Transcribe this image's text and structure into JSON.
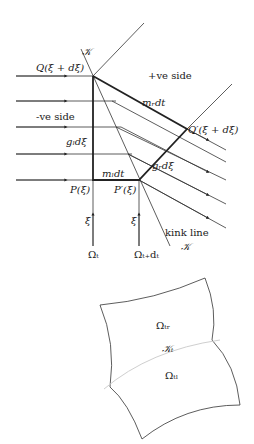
{
  "upper_diagram": {
    "points": {
      "Q": "Q(ξ + dξ)",
      "Q_prime": "Q′(ξ + dξ)",
      "P": "P(ξ)",
      "P_prime": "P′(ξ)"
    },
    "regions": {
      "positive": "+ve side",
      "negative": "-ve side"
    },
    "segments": {
      "m_r": "mᵣdt",
      "m_l": "mₗdt",
      "g_l": "gₗdξ",
      "g_r": "gᵣdξ"
    },
    "kink": {
      "top_label": "𝒦",
      "bottom_label_line1": "kink line",
      "bottom_label_line2": "𝒦"
    },
    "axes": {
      "xi_left": "ξ",
      "xi_right": "ξ",
      "omega_t": "Ωₜ",
      "omega_t_dt": "Ωₜ₊dₜ"
    }
  },
  "lower_diagram": {
    "region_top": "Ωₜᵣ",
    "kink_label": "𝒦ₜ",
    "region_bottom": "Ωₜₗ"
  }
}
